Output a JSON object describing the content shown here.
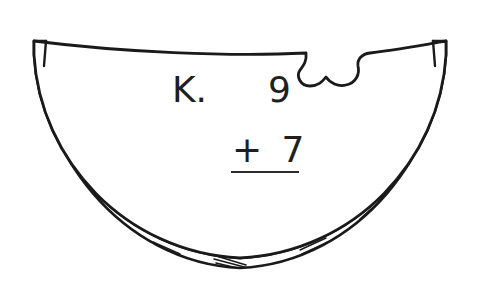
{
  "worksheet": {
    "title": "Watermelon slice addition problem",
    "background_color": "#ffffff",
    "ink_color": "#1a1a1a",
    "text_color": "#1f1f1f",
    "width": 481,
    "height": 283
  },
  "illustration": {
    "subject": "watermelon-slice",
    "description": "Half-circle watermelon slice with a bite taken out of the upper right edge",
    "outline_color": "#1a1a1a",
    "fill_color": "#ffffff",
    "rind_hatching": "short diagonal shading strokes along the curved rind",
    "bite_location": "upper-right"
  },
  "problem": {
    "label": "K.",
    "addend_top": "9",
    "operator_and_addend": "+ 7",
    "answer": "",
    "answer_placeholder": ""
  }
}
